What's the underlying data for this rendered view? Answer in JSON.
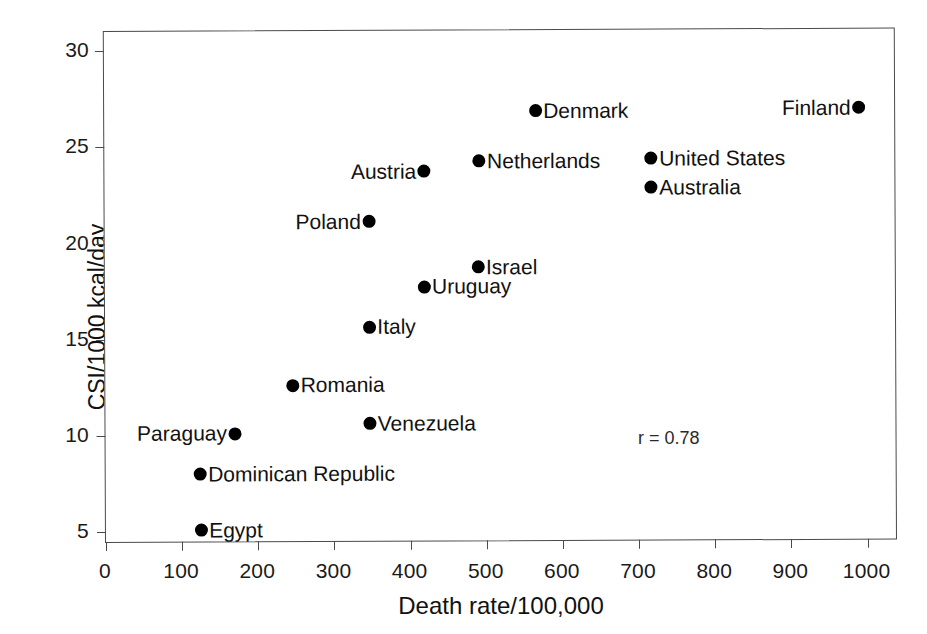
{
  "chart_data": {
    "type": "scatter",
    "title": "",
    "xlabel": "Death rate/100,000",
    "ylabel": "CSI/1000 kcal/day",
    "xlim": [
      0,
      1040
    ],
    "ylim": [
      4.4,
      31.0
    ],
    "xticks": [
      0,
      100,
      200,
      300,
      400,
      500,
      600,
      700,
      800,
      900,
      1000
    ],
    "yticks": [
      5,
      10,
      15,
      20,
      25,
      30
    ],
    "grid": false,
    "legend": null,
    "annotations": [
      {
        "text": "r = 0.78",
        "x": 700,
        "y": 10.4
      }
    ],
    "points": [
      {
        "label": "Denmark",
        "x": 566,
        "y": 26.8,
        "label_side": "right"
      },
      {
        "label": "Finland",
        "x": 991,
        "y": 26.9,
        "label_side": "left"
      },
      {
        "label": "Netherlands",
        "x": 492,
        "y": 24.2,
        "label_side": "right"
      },
      {
        "label": "United States",
        "x": 718,
        "y": 24.3,
        "label_side": "right"
      },
      {
        "label": "Australia",
        "x": 718,
        "y": 22.8,
        "label_side": "right"
      },
      {
        "label": "Austria",
        "x": 420,
        "y": 23.7,
        "label_side": "left"
      },
      {
        "label": "Poland",
        "x": 347,
        "y": 21.1,
        "label_side": "left"
      },
      {
        "label": "Israel",
        "x": 490,
        "y": 18.7,
        "label_side": "right"
      },
      {
        "label": "Uruguay",
        "x": 419,
        "y": 17.7,
        "label_side": "right"
      },
      {
        "label": "Italy",
        "x": 347,
        "y": 15.6,
        "label_side": "right"
      },
      {
        "label": "Romania",
        "x": 246,
        "y": 12.6,
        "label_side": "right"
      },
      {
        "label": "Venezuela",
        "x": 347,
        "y": 10.6,
        "label_side": "right"
      },
      {
        "label": "Paraguay",
        "x": 170,
        "y": 10.1,
        "label_side": "left"
      },
      {
        "label": "Dominican Republic",
        "x": 124,
        "y": 8.0,
        "label_side": "right"
      },
      {
        "label": "Egypt",
        "x": 125,
        "y": 5.1,
        "label_side": "right"
      }
    ],
    "colors": {
      "marker": "#000000",
      "axis": "#4a4a4a",
      "text": "#111111",
      "background": "#ffffff"
    }
  }
}
